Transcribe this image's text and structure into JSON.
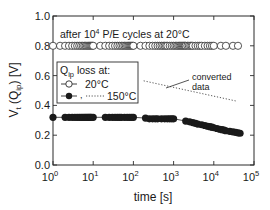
{
  "chart_data": {
    "type": "scatter",
    "title": "",
    "xlabel": "time [s]",
    "ylabel": "V_t (Q_ip) [V]",
    "xscale": "log",
    "xlim": [
      1,
      100000
    ],
    "ylim": [
      0.0,
      1.0
    ],
    "grid": false,
    "x_ticks": [
      {
        "value": 1,
        "base": "10",
        "exp": "0"
      },
      {
        "value": 10,
        "base": "10",
        "exp": "1"
      },
      {
        "value": 100,
        "base": "10",
        "exp": "2"
      },
      {
        "value": 1000,
        "base": "10",
        "exp": "3"
      },
      {
        "value": 10000,
        "base": "10",
        "exp": "4"
      },
      {
        "value": 100000,
        "base": "10",
        "exp": "5"
      }
    ],
    "y_ticks": [
      {
        "value": 0.0,
        "label": "0.0"
      },
      {
        "value": 0.2,
        "label": "0.2"
      },
      {
        "value": 0.4,
        "label": "0.4"
      },
      {
        "value": 0.6,
        "label": "0.6"
      },
      {
        "value": 0.8,
        "label": "0.8"
      },
      {
        "value": 1.0,
        "label": "1.0"
      }
    ],
    "annotation_top": {
      "prefix": "after 10",
      "exp": "4",
      "suffix": " P/E cycles at 20°C"
    },
    "annotation_converted": {
      "line1": "converted",
      "line2": "data"
    },
    "legend": {
      "title_main": "Q",
      "title_sub": "ip",
      "title_rest": " loss at:",
      "entries": [
        {
          "label": "20°C",
          "marker": "open-circle"
        },
        {
          "label": "150°C",
          "marker": "filled-circle",
          "extra": "dotted"
        }
      ],
      "position": "upper-left-middle"
    },
    "series": [
      {
        "name": "20°C",
        "marker": "open-circle",
        "x": [
          1,
          1.5,
          2,
          2.5,
          3,
          3.5,
          4,
          4.5,
          5,
          5.5,
          6,
          6.5,
          7,
          7.5,
          8,
          8.5,
          9,
          9.5,
          10,
          15,
          20,
          25,
          30,
          35,
          40,
          45,
          50,
          55,
          60,
          65,
          70,
          75,
          80,
          85,
          90,
          95,
          100,
          150,
          200,
          250,
          300,
          350,
          400,
          450,
          500,
          550,
          600,
          650,
          700,
          800,
          900,
          1000,
          1100,
          1200,
          1300,
          1400,
          1500,
          1600,
          1700,
          1800,
          1900,
          2000,
          2200,
          2400,
          2600,
          2800,
          3000,
          3500,
          4000,
          4500,
          5000,
          6000,
          7000,
          8000,
          9000,
          10000,
          15000,
          20000,
          30000,
          40000
        ],
        "values": [
          0.8,
          0.8,
          0.8,
          0.8,
          0.8,
          0.8,
          0.8,
          0.8,
          0.8,
          0.8,
          0.8,
          0.8,
          0.8,
          0.8,
          0.8,
          0.8,
          0.8,
          0.8,
          0.8,
          0.8,
          0.8,
          0.8,
          0.8,
          0.8,
          0.8,
          0.8,
          0.8,
          0.8,
          0.8,
          0.8,
          0.8,
          0.8,
          0.8,
          0.8,
          0.8,
          0.8,
          0.8,
          0.8,
          0.8,
          0.8,
          0.8,
          0.8,
          0.8,
          0.8,
          0.8,
          0.8,
          0.8,
          0.8,
          0.8,
          0.8,
          0.8,
          0.8,
          0.8,
          0.8,
          0.8,
          0.8,
          0.8,
          0.8,
          0.8,
          0.8,
          0.8,
          0.8,
          0.8,
          0.8,
          0.8,
          0.8,
          0.8,
          0.8,
          0.8,
          0.8,
          0.8,
          0.8,
          0.8,
          0.8,
          0.8,
          0.8,
          0.8,
          0.8,
          0.8,
          0.8
        ]
      },
      {
        "name": "150°C",
        "marker": "filled-circle",
        "x": [
          1,
          2,
          2.5,
          3,
          3.5,
          4,
          4.5,
          5,
          5.5,
          6,
          6.5,
          7,
          7.5,
          8,
          8.5,
          9,
          10,
          20,
          25,
          30,
          35,
          40,
          45,
          50,
          60,
          70,
          80,
          90,
          100,
          200,
          250,
          300,
          350,
          400,
          500,
          600,
          700,
          800,
          900,
          1000,
          2000,
          2500,
          3000,
          3500,
          4000,
          5000,
          6000,
          7000,
          8000,
          9000,
          10000,
          12000,
          14000,
          16000,
          18000,
          20000,
          25000,
          30000,
          35000,
          40000,
          45000
        ],
        "values": [
          0.32,
          0.32,
          0.32,
          0.32,
          0.32,
          0.32,
          0.32,
          0.32,
          0.32,
          0.32,
          0.32,
          0.32,
          0.32,
          0.32,
          0.32,
          0.32,
          0.32,
          0.32,
          0.32,
          0.32,
          0.32,
          0.32,
          0.32,
          0.32,
          0.32,
          0.32,
          0.32,
          0.32,
          0.32,
          0.315,
          0.31,
          0.31,
          0.31,
          0.31,
          0.31,
          0.31,
          0.31,
          0.31,
          0.31,
          0.31,
          0.295,
          0.29,
          0.285,
          0.28,
          0.275,
          0.27,
          0.265,
          0.26,
          0.257,
          0.254,
          0.25,
          0.245,
          0.24,
          0.237,
          0.234,
          0.23,
          0.226,
          0.222,
          0.219,
          0.216,
          0.213
        ]
      },
      {
        "name": "converted data",
        "marker": "none",
        "line": "dotted",
        "x": [
          180,
          35000
        ],
        "values": [
          0.565,
          0.43
        ]
      }
    ]
  }
}
